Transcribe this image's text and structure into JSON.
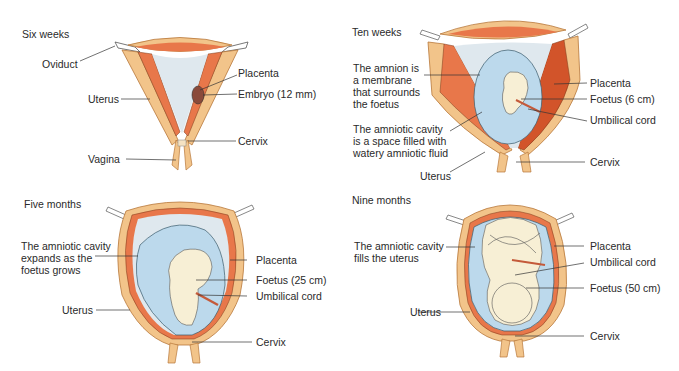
{
  "panels": [
    {
      "title": "Six weeks",
      "labels": {
        "oviduct": "Oviduct",
        "placenta": "Placenta",
        "uterus": "Uterus",
        "embryo": "Embryo (12 mm)",
        "cervix": "Cervix",
        "vagina": "Vagina"
      }
    },
    {
      "title": "Ten weeks",
      "labels": {
        "amnion": "The amnion is\na membrane\nthat surrounds\nthe foetus",
        "placenta": "Placenta",
        "foetus": "Foetus (6 cm)",
        "umbilical": "Umbilical cord",
        "amniotic_cavity": "The amniotic cavity\nis a space filled with\nwatery amniotic fluid",
        "cervix": "Cervix",
        "uterus": "Uterus"
      }
    },
    {
      "title": "Five months",
      "labels": {
        "amniotic_cavity": "The amniotic cavity\nexpands as the\nfoetus grows",
        "placenta": "Placenta",
        "foetus": "Foetus (25 cm)",
        "umbilical": "Umbilical  cord",
        "uterus": "Uterus",
        "cervix": "Cervix"
      }
    },
    {
      "title": "Nine months",
      "labels": {
        "amniotic_cavity": "The amniotic cavity\nfills the uterus",
        "placenta": "Placenta",
        "umbilical": "Umbilical cord",
        "foetus": "Foetus (50 cm)",
        "uterus": "Uterus",
        "cervix": "Cervix"
      }
    }
  ],
  "colors": {
    "uterus_wall": "#f2c48a",
    "uterus_outline": "#b8773a",
    "lining": "#e8774a",
    "lining_dark": "#d2542a",
    "cavity": "#dfe8ee",
    "amnion": "#bcd9ec",
    "foetus": "#f7efd5",
    "text": "#2a2a2a"
  }
}
